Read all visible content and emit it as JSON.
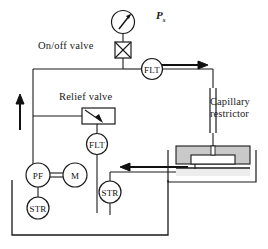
{
  "diagram": {
    "type": "hydraulic-schematic",
    "canvas": {
      "width": 268,
      "height": 249,
      "background": "#ffffff"
    },
    "stroke_color": "#1a1a1a",
    "fill_gray": "#c9c9c9",
    "fill_light": "#ededed",
    "labels": {
      "on_off_valve": "On/off  valve",
      "relief_valve": "Relief  valve",
      "capillary_restrictor": "Capillary restrictor",
      "supply_pressure_symbol": "P",
      "supply_pressure_subscript": "s"
    },
    "components": [
      {
        "id": "pressure-gauge",
        "label": "",
        "kind": "gauge",
        "cx": 123,
        "cy": 22
      },
      {
        "id": "on-off-valve",
        "label": "",
        "kind": "valve",
        "cx": 123,
        "cy": 50
      },
      {
        "id": "filter-supply",
        "label": "FLT",
        "kind": "filter",
        "cx": 152,
        "cy": 69
      },
      {
        "id": "capillary",
        "label": "",
        "kind": "capillary",
        "cx": 213,
        "cy": 110
      },
      {
        "id": "bearing-pad",
        "label": "",
        "kind": "bearing",
        "cx": 213,
        "cy": 160
      },
      {
        "id": "relief-valve",
        "label": "",
        "kind": "relief",
        "cx": 100,
        "cy": 116
      },
      {
        "id": "filter-relief",
        "label": "FLT",
        "kind": "filter",
        "cx": 97,
        "cy": 144
      },
      {
        "id": "pump",
        "label": "PF",
        "kind": "pump",
        "cx": 38,
        "cy": 175
      },
      {
        "id": "motor",
        "label": "M",
        "kind": "motor",
        "cx": 75,
        "cy": 175
      },
      {
        "id": "strainer-pump",
        "label": "STR",
        "kind": "strainer",
        "cx": 38,
        "cy": 208
      },
      {
        "id": "strainer-return",
        "label": "STR",
        "kind": "strainer",
        "cx": 110,
        "cy": 192
      },
      {
        "id": "reservoir",
        "label": "",
        "kind": "tank",
        "cx": 100,
        "cy": 225
      }
    ],
    "flow_arrows": [
      {
        "id": "arrow-to-capillary",
        "direction": "right",
        "x": 178,
        "y": 65
      },
      {
        "id": "arrow-return",
        "direction": "left",
        "x": 128,
        "y": 168
      },
      {
        "id": "arrow-supply-riser",
        "direction": "up",
        "x": 20,
        "y": 120
      }
    ]
  }
}
